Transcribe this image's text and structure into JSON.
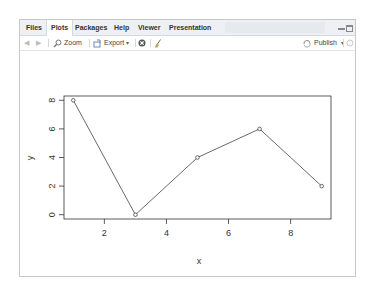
{
  "tabs": [
    {
      "label": "Files",
      "active": false
    },
    {
      "label": "Plots",
      "active": true
    },
    {
      "label": "Packages",
      "active": false
    },
    {
      "label": "Help",
      "active": false
    },
    {
      "label": "Viewer",
      "active": false
    },
    {
      "label": "Presentation",
      "active": false
    }
  ],
  "toolbar": {
    "back_icon": "arrow-left-icon",
    "forward_icon": "arrow-right-icon",
    "zoom_label": "Zoom",
    "export_label": "Export",
    "remove_icon": "remove-plot-icon",
    "clear_icon": "broom-icon",
    "publish_label": "Publish",
    "refresh_icon": "refresh-icon"
  },
  "chart_data": {
    "type": "line",
    "x": [
      1,
      3,
      5,
      7,
      9
    ],
    "values": [
      8,
      0,
      4,
      6,
      2
    ],
    "markers": "open-circle",
    "title": "",
    "xlabel": "x",
    "ylabel": "y",
    "xticks": [
      "2",
      "4",
      "6",
      "8"
    ],
    "yticks": [
      "0",
      "2",
      "4",
      "6",
      "8"
    ],
    "xlim": [
      0.7,
      9.3
    ],
    "ylim": [
      -0.3,
      8.3
    ],
    "grid": false,
    "legend": null
  }
}
